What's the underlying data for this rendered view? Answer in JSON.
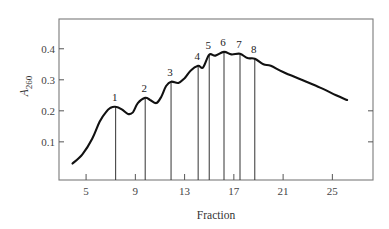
{
  "chart_data": {
    "type": "line",
    "title": "",
    "xlabel": "Fraction",
    "ylabel": "A",
    "ylabel_subscript": "260",
    "xlim": [
      2.8,
      28.3
    ],
    "ylim": [
      -0.023,
      0.496
    ],
    "x_ticks": [
      5,
      9,
      13,
      17,
      21,
      25
    ],
    "x_tick_labels": [
      "5",
      "9",
      "13",
      "17",
      "21",
      "25"
    ],
    "y_ticks": [
      0.1,
      0.2,
      0.3,
      0.4
    ],
    "y_tick_labels": [
      "0.1",
      "0.2",
      "0.3",
      "0.4"
    ],
    "right_axis_ticks": [
      0.1,
      0.2
    ],
    "grid": false,
    "legend": null,
    "series": [
      {
        "name": "A260 absorbance profile",
        "x": [
          3.9,
          4.7,
          5.5,
          6.1,
          6.6,
          7.0,
          7.4,
          7.9,
          8.4,
          8.8,
          9.2,
          9.8,
          10.2,
          10.7,
          11.1,
          11.5,
          11.9,
          12.5,
          13.0,
          13.5,
          14.1,
          14.5,
          15.0,
          15.5,
          16.2,
          16.8,
          17.5,
          18.1,
          18.7,
          19.4,
          20.0,
          21.0,
          22.5,
          24.0,
          25.3,
          26.2
        ],
        "y": [
          0.03,
          0.06,
          0.11,
          0.165,
          0.195,
          0.21,
          0.213,
          0.205,
          0.19,
          0.195,
          0.225,
          0.242,
          0.235,
          0.225,
          0.245,
          0.28,
          0.294,
          0.29,
          0.305,
          0.33,
          0.345,
          0.34,
          0.381,
          0.378,
          0.39,
          0.382,
          0.384,
          0.37,
          0.368,
          0.35,
          0.345,
          0.325,
          0.3,
          0.275,
          0.25,
          0.235
        ]
      }
    ],
    "peaks": [
      {
        "label": "1",
        "fraction": 7.4,
        "a260": 0.213
      },
      {
        "label": "2",
        "fraction": 9.8,
        "a260": 0.242
      },
      {
        "label": "3",
        "fraction": 11.9,
        "a260": 0.294
      },
      {
        "label": "4",
        "fraction": 14.1,
        "a260": 0.345
      },
      {
        "label": "5",
        "fraction": 15.0,
        "a260": 0.381
      },
      {
        "label": "6",
        "fraction": 16.2,
        "a260": 0.39
      },
      {
        "label": "7",
        "fraction": 17.5,
        "a260": 0.384
      },
      {
        "label": "8",
        "fraction": 18.7,
        "a260": 0.368
      }
    ],
    "annotations": "Vertical drop lines from each numbered peak (1-8) to the x-axis"
  },
  "colors": {
    "frame": "#7a7a7a",
    "curve": "#111111",
    "text": "#333333",
    "background": "#ffffff"
  }
}
